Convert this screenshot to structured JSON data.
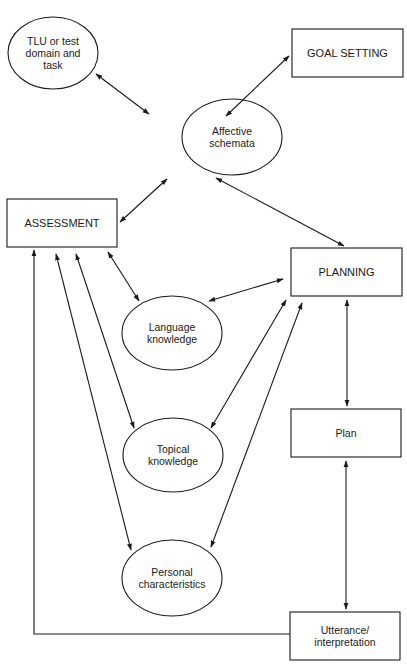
{
  "diagram": {
    "type": "flow-diagram",
    "stroke_color": "#1a1a1a",
    "background_color": "#ffffff",
    "nodes": {
      "tlu": {
        "shape": "ellipse",
        "label": "TLU or test\ndomain and\ntask"
      },
      "goal_setting": {
        "shape": "rectangle",
        "label": "GOAL SETTING"
      },
      "affective": {
        "shape": "ellipse",
        "label": "Affective\nschemata"
      },
      "assessment": {
        "shape": "rectangle",
        "label": "ASSESSMENT"
      },
      "planning": {
        "shape": "rectangle",
        "label": "PLANNING"
      },
      "language": {
        "shape": "ellipse",
        "label": "Language\nknowledge"
      },
      "topical": {
        "shape": "ellipse",
        "label": "Topical\nknowledge"
      },
      "personal": {
        "shape": "ellipse",
        "label": "Personal\ncharacteristics"
      },
      "plan": {
        "shape": "rectangle",
        "label": "Plan"
      },
      "utterance": {
        "shape": "rectangle",
        "label": "Utterance/\ninterpretation"
      }
    },
    "edges": [
      {
        "from": "tlu",
        "to": "affective",
        "direction": "both"
      },
      {
        "from": "goal_setting",
        "to": "affective",
        "direction": "both"
      },
      {
        "from": "affective",
        "to": "assessment",
        "direction": "both"
      },
      {
        "from": "affective",
        "to": "planning",
        "direction": "both"
      },
      {
        "from": "assessment",
        "to": "language",
        "direction": "both"
      },
      {
        "from": "assessment",
        "to": "topical",
        "direction": "both"
      },
      {
        "from": "assessment",
        "to": "personal",
        "direction": "both"
      },
      {
        "from": "language",
        "to": "planning",
        "direction": "both"
      },
      {
        "from": "topical",
        "to": "planning",
        "direction": "both"
      },
      {
        "from": "personal",
        "to": "planning",
        "direction": "both"
      },
      {
        "from": "planning",
        "to": "plan",
        "direction": "both"
      },
      {
        "from": "plan",
        "to": "utterance",
        "direction": "both"
      },
      {
        "from": "utterance",
        "to": "assessment",
        "direction": "forward"
      }
    ]
  }
}
